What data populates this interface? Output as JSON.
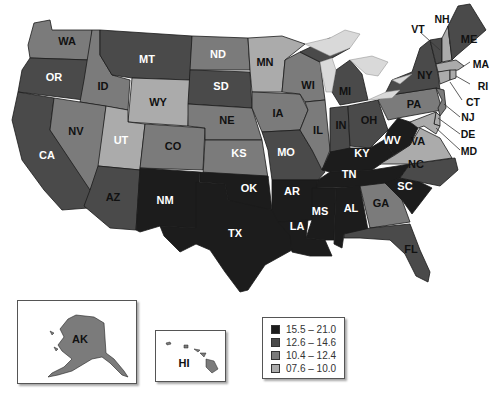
{
  "colors": {
    "c1": "#1c1c1c",
    "c2": "#4a4a4a",
    "c3": "#7b7b7b",
    "c4": "#ababab",
    "lake": "#d9d9d9"
  },
  "legend": {
    "items": [
      {
        "label": "15.5 – 21.0",
        "color": "#1c1c1c"
      },
      {
        "label": "12.6 – 14.6",
        "color": "#4a4a4a"
      },
      {
        "label": "10.4 – 12.4",
        "color": "#7b7b7b"
      },
      {
        "label": "07.6 – 10.0",
        "color": "#ababab"
      }
    ]
  },
  "states": {
    "WA": {
      "label": "WA",
      "class": "10.4 – 12.4"
    },
    "OR": {
      "label": "OR",
      "class": "12.6 – 14.6"
    },
    "CA": {
      "label": "CA",
      "class": "12.6 – 14.6"
    },
    "ID": {
      "label": "ID",
      "class": "10.4 – 12.4"
    },
    "NV": {
      "label": "NV",
      "class": "10.4 – 12.4"
    },
    "MT": {
      "label": "MT",
      "class": "12.6 – 14.6"
    },
    "WY": {
      "label": "WY",
      "class": "07.6 – 10.0"
    },
    "UT": {
      "label": "UT",
      "class": "07.6 – 10.0"
    },
    "AZ": {
      "label": "AZ",
      "class": "12.6 – 14.6"
    },
    "CO": {
      "label": "CO",
      "class": "10.4 – 12.4"
    },
    "NM": {
      "label": "NM",
      "class": "15.5 – 21.0"
    },
    "ND": {
      "label": "ND",
      "class": "10.4 – 12.4"
    },
    "SD": {
      "label": "SD",
      "class": "12.6 – 14.6"
    },
    "NE": {
      "label": "NE",
      "class": "10.4 – 12.4"
    },
    "KS": {
      "label": "KS",
      "class": "10.4 – 12.4"
    },
    "OK": {
      "label": "OK",
      "class": "15.5 – 21.0"
    },
    "TX": {
      "label": "TX",
      "class": "15.5 – 21.0"
    },
    "MN": {
      "label": "MN",
      "class": "07.6 – 10.0"
    },
    "IA": {
      "label": "IA",
      "class": "10.4 – 12.4"
    },
    "MO": {
      "label": "MO",
      "class": "12.6 – 14.6"
    },
    "AR": {
      "label": "AR",
      "class": "15.5 – 21.0"
    },
    "LA": {
      "label": "LA",
      "class": "15.5 – 21.0"
    },
    "WI": {
      "label": "WI",
      "class": "10.4 – 12.4"
    },
    "IL": {
      "label": "IL",
      "class": "10.4 – 12.4"
    },
    "MI": {
      "label": "MI",
      "class": "12.6 – 14.6"
    },
    "IN": {
      "label": "IN",
      "class": "12.6 – 14.6"
    },
    "OH": {
      "label": "OH",
      "class": "12.6 – 14.6"
    },
    "KY": {
      "label": "KY",
      "class": "15.5 – 21.0"
    },
    "TN": {
      "label": "TN",
      "class": "15.5 – 21.0"
    },
    "MS": {
      "label": "MS",
      "class": "15.5 – 21.0"
    },
    "AL": {
      "label": "AL",
      "class": "15.5 – 21.0"
    },
    "GA": {
      "label": "GA",
      "class": "10.4 – 12.4"
    },
    "FL": {
      "label": "FL",
      "class": "12.6 – 14.6"
    },
    "SC": {
      "label": "SC",
      "class": "15.5 – 21.0"
    },
    "NC": {
      "label": "NC",
      "class": "12.6 – 14.6"
    },
    "VA": {
      "label": "VA",
      "class": "07.6 – 10.0"
    },
    "WV": {
      "label": "WV",
      "class": "15.5 – 21.0"
    },
    "PA": {
      "label": "PA",
      "class": "10.4 – 12.4"
    },
    "NY": {
      "label": "NY",
      "class": "12.6 – 14.6"
    },
    "VT": {
      "label": "VT",
      "class": "07.6 – 10.0"
    },
    "NH": {
      "label": "NH",
      "class": "07.6 – 10.0"
    },
    "ME": {
      "label": "ME",
      "class": "12.6 – 14.6"
    },
    "MA": {
      "label": "MA",
      "class": "07.6 – 10.0"
    },
    "RI": {
      "label": "RI",
      "class": "07.6 – 10.0"
    },
    "CT": {
      "label": "CT",
      "class": "07.6 – 10.0"
    },
    "NJ": {
      "label": "NJ",
      "class": "10.4 – 12.4"
    },
    "DE": {
      "label": "DE",
      "class": "07.6 – 10.0"
    },
    "MD": {
      "label": "MD",
      "class": "07.6 – 10.0"
    },
    "AK": {
      "label": "AK",
      "class": "10.4 – 12.4"
    },
    "HI": {
      "label": "HI",
      "class": "10.4 – 12.4"
    }
  }
}
